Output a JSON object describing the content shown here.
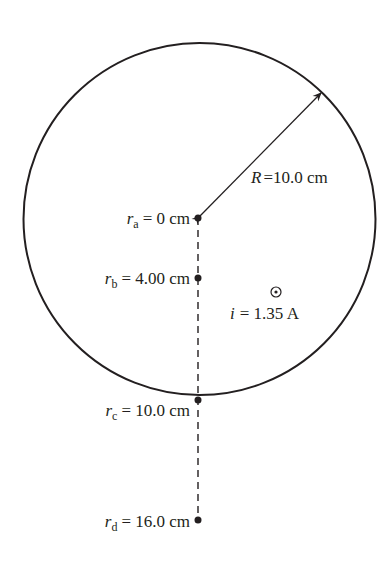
{
  "diagram": {
    "type": "wire-cross-section",
    "circle": {
      "label_symbol": "R",
      "label_value": "=10.0 cm"
    },
    "current": {
      "symbol": "i",
      "value": "= 1.35 A",
      "direction_icon": "out-of-page-dot"
    },
    "points": [
      {
        "symbol": "r",
        "sub": "a",
        "value": "= 0 cm"
      },
      {
        "symbol": "r",
        "sub": "b",
        "value": "= 4.00 cm"
      },
      {
        "symbol": "r",
        "sub": "c",
        "value": "= 10.0 cm"
      },
      {
        "symbol": "r",
        "sub": "d",
        "value": "= 16.0 cm"
      }
    ],
    "colors": {
      "stroke": "#231f20",
      "background": "#ffffff"
    }
  }
}
